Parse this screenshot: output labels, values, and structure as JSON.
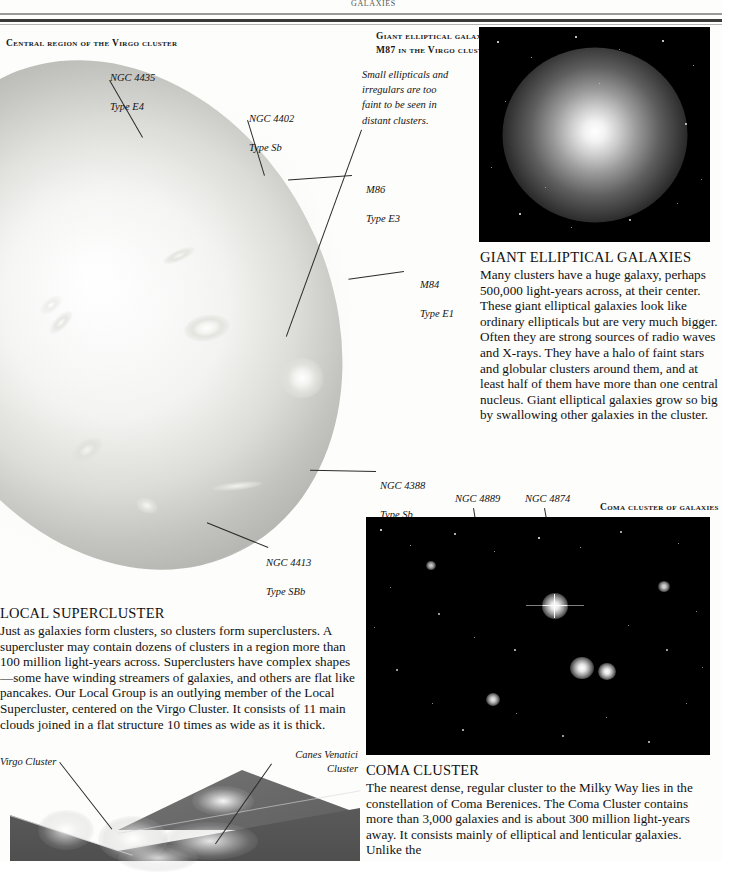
{
  "page": {
    "running_head": "GALAXIES"
  },
  "plates": {
    "virgo": {
      "caption": "Central region of the Virgo cluster",
      "note": "Small ellipticals and\nirregulars are too\nfaint to be seen in\ndistant clusters.",
      "labels": [
        {
          "name": "NGC 4435",
          "type": "Type E4"
        },
        {
          "name": "NGC 4402",
          "type": "Type Sb"
        },
        {
          "name": "M86",
          "type": "Type E3"
        },
        {
          "name": "M84",
          "type": "Type E1"
        },
        {
          "name": "NGC 4388",
          "type": "Type Sb"
        },
        {
          "name": "NGC 4413",
          "type": "Type SBb"
        }
      ]
    },
    "m87": {
      "caption_line1": "Giant elliptical galaxy",
      "caption_line2": "M87 in the Virgo cluster"
    },
    "coma": {
      "caption": "Coma cluster of galaxies",
      "labels": [
        {
          "name": "NGC 4889",
          "type": "Type E4"
        },
        {
          "name": "NGC 4874",
          "type": "Type E0"
        }
      ]
    },
    "supercluster": {
      "label_virgo": "Virgo Cluster",
      "label_canes": "Canes Venatici\nCluster"
    }
  },
  "sections": {
    "giant_elliptical": {
      "title": "GIANT ELLIPTICAL GALAXIES",
      "body": "Many clusters have a huge galaxy, perhaps 500,000 light-years across, at their center. These giant elliptical galaxies look like ordinary ellipticals but are very much bigger. Often they are strong sources of radio waves and X-rays. They have a halo of faint stars and globular clusters around them, and at least half of them have more than one central nucleus. Giant elliptical galaxies grow so big by swallowing other galaxies in the cluster."
    },
    "local_supercluster": {
      "title": "LOCAL SUPERCLUSTER",
      "body": "Just as galaxies form clusters, so clusters form superclusters. A supercluster may contain dozens of clusters in a region more than 100 million light-years across. Superclusters have complex shapes—some have winding streamers of galaxies, and others are flat like pancakes. Our Local Group is an outlying member of the Local Supercluster, centered on the Virgo Cluster. It consists of 11 main clouds joined in a flat structure 10 times as wide as it is thick."
    },
    "coma_cluster": {
      "title": "COMA CLUSTER",
      "body": "The nearest dense, regular cluster to the Milky Way lies in the constellation of Coma Berenices. The Coma Cluster contains more than 3,000 galaxies and is about 300 million light-years away. It consists mainly of elliptical and lenticular galaxies. Unlike the"
    }
  }
}
